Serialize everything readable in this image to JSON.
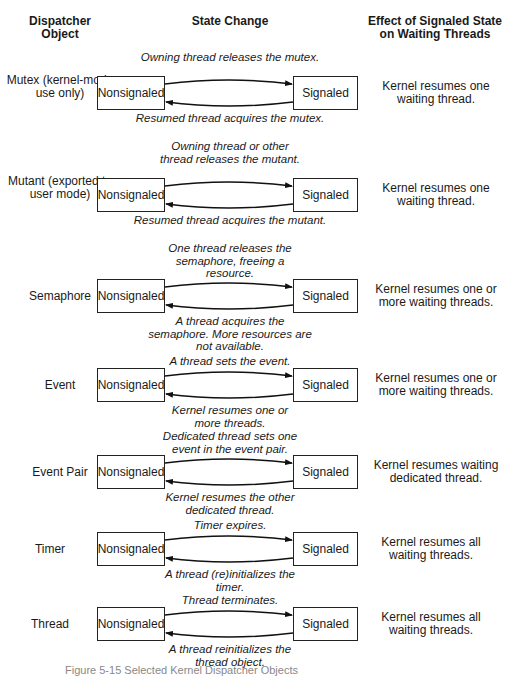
{
  "headers": {
    "object": "Dispatcher Object",
    "change": "State Change",
    "effect": "Effect of Signaled State on Waiting Threads"
  },
  "states": {
    "nonsignaled": "Nonsignaled",
    "signaled": "Signaled"
  },
  "rows": [
    {
      "object": "Mutex (kernel-mode use only)",
      "to_signaled": "Owning thread releases the mutex.",
      "to_nonsignaled": "Resumed thread acquires the mutex.",
      "effect": "Kernel resumes one waiting thread."
    },
    {
      "object": "Mutant (exported to user mode)",
      "to_signaled": "Owning thread or other thread releases the mutant.",
      "to_nonsignaled": "Resumed thread acquires the mutant.",
      "effect": "Kernel resumes one waiting thread."
    },
    {
      "object": "Semaphore",
      "to_signaled": "One thread releases the semaphore, freeing a resource.",
      "to_nonsignaled": "A thread acquires the semaphore. More resources are not available.",
      "effect": "Kernel resumes one or more waiting threads."
    },
    {
      "object": "Event",
      "to_signaled": "A thread sets the event.",
      "to_nonsignaled": "Kernel resumes one or more threads.",
      "effect": "Kernel resumes one or more waiting threads."
    },
    {
      "object": "Event Pair",
      "to_signaled": "Dedicated thread sets one event in the event pair.",
      "to_nonsignaled": "Kernel resumes the other dedicated thread.",
      "effect": "Kernel resumes waiting dedicated thread."
    },
    {
      "object": "Timer",
      "to_signaled": "Timer expires.",
      "to_nonsignaled": "A thread (re)initializes the timer.",
      "effect": "Kernel resumes all waiting threads."
    },
    {
      "object": "Thread",
      "to_signaled": "Thread terminates.",
      "to_nonsignaled": "A thread reinitializes the thread object.",
      "effect": "Kernel resumes all waiting threads."
    }
  ],
  "caption": "Figure 5-15 Selected Kernel Dispatcher Objects"
}
